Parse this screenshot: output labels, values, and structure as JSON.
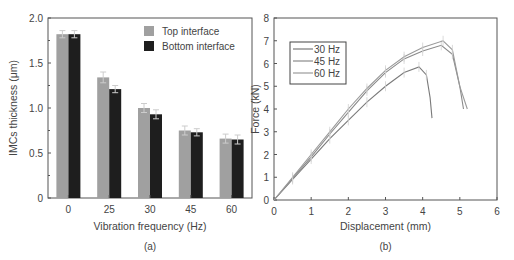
{
  "chart_data": [
    {
      "type": "bar",
      "panel_label": "(a)",
      "title": "",
      "xlabel": "Vibration frequency (Hz)",
      "ylabel": "IMCs thickness (μm)",
      "categories": [
        "0",
        "25",
        "30",
        "45",
        "60"
      ],
      "ylim": [
        0,
        2.0
      ],
      "yticks": [
        "0",
        "0.5",
        "1.0",
        "1.5",
        "2.0"
      ],
      "grid": false,
      "legend_position": "upper right",
      "series": [
        {
          "name": "Top interface",
          "color": "#a0a0a0",
          "values": [
            1.82,
            1.34,
            1.0,
            0.75,
            0.66
          ],
          "errors": [
            0.04,
            0.06,
            0.05,
            0.05,
            0.05
          ]
        },
        {
          "name": "Bottom interface",
          "color": "#1e1e1e",
          "values": [
            1.82,
            1.21,
            0.93,
            0.73,
            0.65
          ],
          "errors": [
            0.04,
            0.04,
            0.05,
            0.04,
            0.05
          ]
        }
      ]
    },
    {
      "type": "line",
      "panel_label": "(b)",
      "title": "",
      "xlabel": "Displacement (mm)",
      "ylabel": "Force (kN)",
      "xlim": [
        0,
        6
      ],
      "ylim": [
        0,
        8
      ],
      "xticks": [
        "0",
        "1",
        "2",
        "3",
        "4",
        "5",
        "6"
      ],
      "yticks": [
        "0",
        "1",
        "2",
        "3",
        "4",
        "5",
        "6",
        "7",
        "8"
      ],
      "grid": false,
      "legend_position": "upper left",
      "series": [
        {
          "name": "30 Hz",
          "color": "#7a7a7a",
          "x": [
            0,
            0.5,
            1.0,
            1.5,
            2.0,
            2.5,
            3.0,
            3.5,
            3.9,
            4.1,
            4.2,
            4.25
          ],
          "y": [
            0,
            0.9,
            1.8,
            2.7,
            3.5,
            4.3,
            5.0,
            5.6,
            5.85,
            5.5,
            4.5,
            3.6
          ]
        },
        {
          "name": "45 Hz",
          "color": "#8a8a8a",
          "x": [
            0,
            0.5,
            1.0,
            1.5,
            2.0,
            2.5,
            3.0,
            3.5,
            4.0,
            4.5,
            4.8,
            5.0,
            5.1
          ],
          "y": [
            0,
            0.95,
            1.9,
            2.9,
            3.85,
            4.8,
            5.6,
            6.2,
            6.55,
            6.8,
            6.4,
            5.0,
            4.0
          ]
        },
        {
          "name": "60 Hz",
          "color": "#9a9a9a",
          "x": [
            0,
            0.5,
            1.0,
            1.5,
            2.0,
            2.5,
            3.0,
            3.5,
            4.0,
            4.55,
            4.8,
            5.0,
            5.2
          ],
          "y": [
            0,
            1.0,
            2.0,
            3.0,
            4.0,
            4.9,
            5.7,
            6.3,
            6.7,
            7.0,
            6.6,
            5.0,
            4.0
          ]
        }
      ]
    }
  ]
}
